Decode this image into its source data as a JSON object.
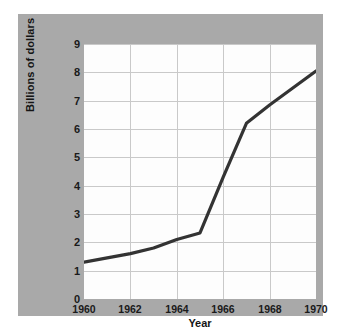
{
  "figure": {
    "background_color": "#a9a9a9",
    "plot_background_color": "#fdfdfd",
    "grid_color": "#c9c9c9",
    "line_color": "#333333"
  },
  "caption": {
    "text": ""
  },
  "chart_data": {
    "type": "line",
    "title": "",
    "subtitle": "",
    "xlabel": "Year",
    "ylabel": "Billions of dollars",
    "xlim": [
      1960,
      1970
    ],
    "ylim": [
      0,
      9
    ],
    "xticks": [
      1960,
      1962,
      1964,
      1966,
      1968,
      1970
    ],
    "xtick_labels": [
      "1960",
      "1962",
      "1964",
      "1966",
      "1968",
      "1970"
    ],
    "yticks": [
      0,
      1,
      2,
      3,
      4,
      5,
      6,
      7,
      8,
      9
    ],
    "ytick_labels": [
      "0",
      "1",
      "2",
      "3",
      "4",
      "5",
      "6",
      "7",
      "8",
      "9"
    ],
    "grid": true,
    "legend": null,
    "legend_position": "none",
    "x": [
      1960,
      1961,
      1962,
      1963,
      1964,
      1965,
      1966,
      1967,
      1968,
      1969,
      1970
    ],
    "values": [
      1.3,
      1.45,
      1.6,
      1.8,
      2.1,
      2.33,
      4.3,
      6.2,
      6.85,
      7.45,
      8.05
    ],
    "series": [
      {
        "name": "Billions of dollars",
        "values": [
          1.3,
          1.45,
          1.6,
          1.8,
          2.1,
          2.33,
          4.3,
          6.2,
          6.85,
          7.45,
          8.05
        ]
      }
    ],
    "annotations": []
  }
}
